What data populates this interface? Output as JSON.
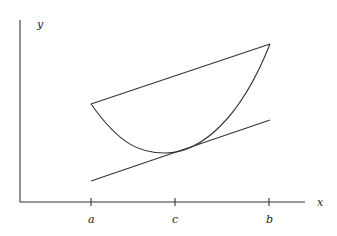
{
  "diagram": {
    "axes": {
      "x_label": "x",
      "y_label": "y"
    },
    "ticks": [
      {
        "label": "a",
        "x": 91
      },
      {
        "label": "c",
        "x": 175
      },
      {
        "label": "b",
        "x": 269
      }
    ],
    "elements": {
      "curve": "convex function f from a to b",
      "secant": "chord from (a,f(a)) to (b,f(b))",
      "tangent": "tangent line at c"
    },
    "colors": {
      "stroke": "#333333",
      "background": "#ffffff"
    }
  }
}
